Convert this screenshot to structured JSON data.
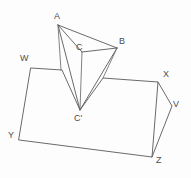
{
  "figure": {
    "background_color": "#fdfdfd",
    "stroke_color": "#595959",
    "label_color": "#4d4d4d",
    "labels": [
      {
        "id": "A",
        "text": "A",
        "x": 54,
        "y": 12
      },
      {
        "id": "B",
        "text": "B",
        "x": 119,
        "y": 37
      },
      {
        "id": "C",
        "text": "C",
        "x": 76,
        "y": 43
      },
      {
        "id": "Cp",
        "text": "C'",
        "x": 74,
        "y": 114
      },
      {
        "id": "W",
        "text": "W",
        "x": 20,
        "y": 54
      },
      {
        "id": "X",
        "text": "X",
        "x": 163,
        "y": 70
      },
      {
        "id": "V",
        "text": "V",
        "x": 173,
        "y": 100
      },
      {
        "id": "Y",
        "text": "Y",
        "x": 8,
        "y": 131
      },
      {
        "id": "Z",
        "text": "Z",
        "x": 156,
        "y": 156
      }
    ],
    "vertices": {
      "A": {
        "x": 58,
        "y": 25
      },
      "B": {
        "x": 117,
        "y": 48
      },
      "C": {
        "x": 82,
        "y": 52
      },
      "Cp": {
        "x": 80,
        "y": 110
      },
      "W": {
        "x": 31,
        "y": 68
      },
      "X": {
        "x": 158,
        "y": 82
      },
      "V": {
        "x": 172,
        "y": 106
      },
      "Y": {
        "x": 19,
        "y": 140
      },
      "Z": {
        "x": 152,
        "y": 157
      },
      "N1": {
        "x": 62,
        "y": 70
      },
      "N2": {
        "x": 103,
        "y": 78
      }
    },
    "paths": {
      "base_outline": "M 31 68 L 62 70 L 80 110 L 103 78 L 158 82 L 152 157 L 19 140 Z",
      "flap_triangle": "M 58 25 L 117 48 L 82 52 Z",
      "fold_left": "M 58 25 L 80 110",
      "fold_right": "M 117 48 L 80 110",
      "edge_A_C": "M 58 25 L 82 52",
      "edge_C_Cp": "M 82 52 L 80 110",
      "side_X_V": "M 158 82 L 172 106",
      "side_V_Z": "M 172 106 L 152 157",
      "crease_left": "M 58 25 L 62 70",
      "crease_right": "M 117 48 L 103 78"
    }
  }
}
